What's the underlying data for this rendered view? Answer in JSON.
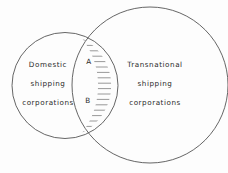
{
  "figure": {
    "type": "venn-diagram",
    "background_color": "#fdfdfd",
    "stroke_color": "#555555",
    "hatch_color": "#777777",
    "text_color": "#2a2a2a"
  },
  "sets": {
    "left": {
      "name": "domestic-shipping-corporations",
      "lines": [
        "Domestic",
        "shipping",
        "corporations"
      ],
      "line1": "Domestic",
      "line2": "shipping",
      "line3": "corporations",
      "cx": 65,
      "cy": 85.5,
      "r": 53
    },
    "right": {
      "name": "transnational-shipping-corporations",
      "lines": [
        "Transnational",
        "shipping",
        "corporations"
      ],
      "line1": "Transnational",
      "line2": "shipping",
      "line3": "corporations",
      "cx": 150,
      "cy": 85,
      "r": 78
    }
  },
  "intersection": {
    "name": "overlap-region",
    "fill": "horizontal-hatch",
    "hatch_spacing_px": 5.4,
    "labels": [
      {
        "text": "A",
        "x": 89,
        "y": 62
      },
      {
        "text": "B",
        "x": 88,
        "y": 101
      }
    ],
    "label_a": "A",
    "label_b": "B"
  }
}
